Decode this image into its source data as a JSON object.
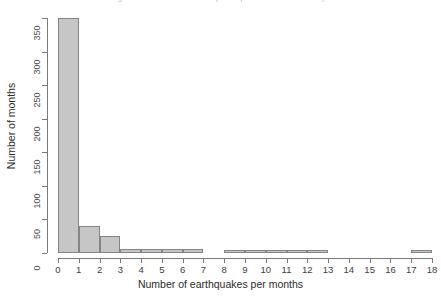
{
  "chart_data": {
    "type": "bar",
    "subtype": "histogram",
    "title": "Histogram of the number of earthquakes per month over the last years",
    "xlabel": "Number of earthquakes per months",
    "ylabel": "Number of months",
    "xlim": [
      0,
      18
    ],
    "ylim": [
      0,
      350
    ],
    "grid": false,
    "legend": null,
    "bin_width": 1,
    "x_ticks": [
      "0",
      "1",
      "2",
      "3",
      "4",
      "5",
      "6",
      "7",
      "8",
      "9",
      "10",
      "11",
      "12",
      "13",
      "14",
      "15",
      "16",
      "17",
      "18"
    ],
    "y_ticks": [
      "0",
      "50",
      "100",
      "150",
      "200",
      "250",
      "300",
      "350"
    ],
    "bin_starts": [
      0,
      1,
      2,
      3,
      4,
      5,
      6,
      7,
      8,
      9,
      10,
      11,
      12,
      13,
      14,
      15,
      16,
      17
    ],
    "bin_labels": [
      "0-1",
      "1-2",
      "2-3",
      "3-4",
      "4-5",
      "5-6",
      "6-7",
      "7-8",
      "8-9",
      "9-10",
      "10-11",
      "11-12",
      "12-13",
      "13-14",
      "14-15",
      "15-16",
      "16-17",
      "17-18"
    ],
    "values": [
      350,
      40,
      25,
      6,
      6,
      6,
      6,
      0,
      3,
      3,
      3,
      3,
      5,
      0,
      0,
      0,
      0,
      4
    ],
    "bar_fill_color": "#c6c6c6",
    "bar_border_color": "#848484",
    "axis_color": "#7a7a7a",
    "background_color": "#ffffff",
    "text_color": "#2b2b2b"
  }
}
